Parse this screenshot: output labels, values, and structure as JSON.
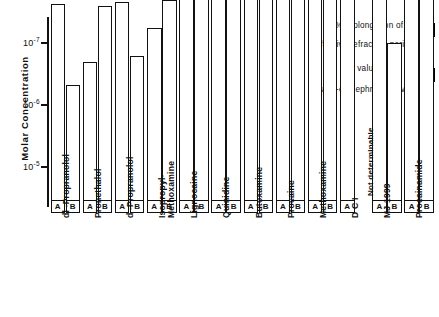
{
  "chart_data": {
    "type": "bar",
    "title": "",
    "xlabel": "",
    "ylabel": "Molar Concentration",
    "yscale": "log-inverted",
    "ylim": [
      1e-05,
      3e-07
    ],
    "yticks": [
      "10-7",
      "10-6",
      "10-5"
    ],
    "ytick_values": [
      1e-07,
      1e-06,
      1e-05
    ],
    "grid": false,
    "legend_position": "top-right",
    "categories": [
      "dl -Propranolol",
      "Pronethalol",
      "d -Propranolol",
      "Isopropyl-\nMethoxamine",
      "Lignocaine",
      "Quinidine",
      "Butoxamine",
      "Procaine",
      "Methoxamine",
      "D C I",
      "MJ 1999",
      "Procainamide"
    ],
    "series": [
      {
        "name": "A",
        "key": "A",
        "label": "25% prolongation of\neffective refractory period",
        "values": [
          1.3e-08,
          1.1e-07,
          1.2e-08,
          3.2e-08,
          8e-09,
          7e-09,
          9e-09,
          6e-09,
          6e-09,
          6e-09,
          6e-09,
          4.5e-09
        ]
      },
      {
        "name": "B",
        "key": "B",
        "label": "pA2 values for\nanti-epinephrine activity",
        "values": [
          2.6e-07,
          1.4e-08,
          9e-08,
          1.1e-08,
          6e-09,
          5e-09,
          1e-08,
          5.5e-09,
          5.5e-09,
          null,
          5.5e-08,
          3.5e-09
        ]
      }
    ],
    "annotations": [
      {
        "text": "Not determinable",
        "category": "D C I",
        "series": "B",
        "rotation": -90
      }
    ]
  },
  "legend": {
    "entries": [
      {
        "text": "25% prolongation of\neffective refractory period",
        "key": "A"
      },
      {
        "text": "pA2 values for\nanti-epinephrine activity",
        "key": "B"
      }
    ],
    "line2_prefix": "p",
    "line2_a": "A",
    "line2_sub": "2",
    "line2_rest": " values for",
    "line2_second": "anti-epinephrine  activity",
    "line1_first": "25%  prolongation  of",
    "line1_second": "effective  refractory  period"
  },
  "axis": {
    "ylabel": "Molar Concentration",
    "ticks": [
      {
        "mantissa": "10",
        "exp": "-7"
      },
      {
        "mantissa": "10",
        "exp": "-6"
      },
      {
        "mantissa": "10",
        "exp": "-5"
      }
    ]
  },
  "colors": {
    "ink": "#111111",
    "background": "#ffffff",
    "bar_fill": "#ffffff"
  }
}
